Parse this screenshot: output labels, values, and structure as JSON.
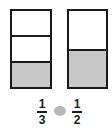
{
  "diagram": {
    "bars": [
      {
        "parts": 3,
        "shaded": 1,
        "fraction": {
          "numerator": "1",
          "denominator": "3"
        }
      },
      {
        "parts": 2,
        "shaded": 1,
        "fraction": {
          "numerator": "1",
          "denominator": "2"
        }
      }
    ],
    "comparison_blank": "",
    "colors": {
      "outline": "#1a1a1a",
      "shade": "#c8c8c8",
      "blank": "#b8b8b8"
    }
  }
}
